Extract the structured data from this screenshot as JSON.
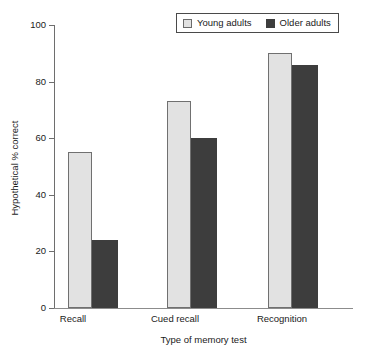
{
  "chart_data": {
    "type": "bar",
    "title": "",
    "subtitle": "",
    "xlabel": "Type of memory test",
    "ylabel": "Hypothetical % correct",
    "categories": [
      "Recall",
      "Cued recall",
      "Recognition"
    ],
    "series": [
      {
        "name": "Young adults",
        "values": [
          55,
          73,
          90
        ],
        "color": "#e2e2e2"
      },
      {
        "name": "Older adults",
        "values": [
          24,
          60,
          86
        ],
        "color": "#3d3d3d"
      }
    ],
    "ylim": [
      0,
      100
    ],
    "yticks": [
      0,
      20,
      40,
      60,
      80,
      100
    ],
    "ytick_labels": [
      "0",
      "20",
      "40",
      "60",
      "80",
      "100"
    ],
    "grid": false,
    "legend_position": "top-right",
    "legend_entries": [
      "Young adults",
      "Older adults"
    ],
    "annotations": []
  },
  "legend": {
    "items": [
      {
        "label": "Young adults",
        "swatch": "young-swatch"
      },
      {
        "label": "Older adults",
        "swatch": "older-swatch"
      }
    ]
  },
  "axes": {
    "y_title": "Hypothetical % correct",
    "x_title": "Type of memory test",
    "y_ticks": [
      "100",
      "80",
      "60",
      "40",
      "20",
      "0"
    ],
    "x_categories": [
      "Recall",
      "Cued recall",
      "Recognition"
    ]
  }
}
